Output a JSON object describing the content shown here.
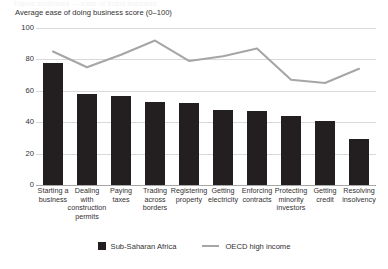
{
  "title_sliver": "Figure continued — ease of doing business",
  "axis_caption": "Average ease of doing business score (0–100)",
  "legend": {
    "items": [
      {
        "label": "Sub-Saharan Africa",
        "marker": "bar-swatch-icon",
        "color": "#231f20"
      },
      {
        "label": "OECD high income",
        "marker": "line-swatch-icon",
        "color": "#a6a6a6"
      }
    ]
  },
  "colors": {
    "bar": "#231f20",
    "line": "#a6a6a6",
    "grid": "#d9d9d9",
    "axis": "#a7a7a7",
    "text": "#333132",
    "background": "#ffffff"
  },
  "chart_data": {
    "type": "bar",
    "title": "",
    "subtitle": "",
    "xlabel": "",
    "ylabel": "Average ease of doing business score (0–100)",
    "ylim": [
      0,
      100
    ],
    "yticks": [
      0,
      20,
      40,
      60,
      80,
      100
    ],
    "grid": true,
    "legend_position": "bottom-center",
    "categories": [
      "Starting a business",
      "Dealing with construction permits",
      "Paying taxes",
      "Trading across borders",
      "Registering property",
      "Getting electricity",
      "Enforcing contracts",
      "Protecting minority investors",
      "Getting credit",
      "Resolving insolvency"
    ],
    "category_lines": [
      [
        "Starting a",
        "business"
      ],
      [
        "Dealing",
        "with",
        "construction",
        "permits"
      ],
      [
        "Paying",
        "taxes"
      ],
      [
        "Trading",
        "across",
        "borders"
      ],
      [
        "Registering",
        "property"
      ],
      [
        "Getting",
        "electricity"
      ],
      [
        "Enforcing",
        "contracts"
      ],
      [
        "Protecting",
        "minority",
        "investors"
      ],
      [
        "Getting",
        "credit"
      ],
      [
        "Resolving",
        "insolvency"
      ]
    ],
    "series": [
      {
        "name": "Sub-Saharan Africa",
        "render": "bar",
        "values": [
          78,
          58,
          57,
          53,
          52,
          48,
          47,
          44,
          41,
          29
        ]
      },
      {
        "name": "OECD high income",
        "render": "line",
        "values": [
          85,
          75,
          83,
          92,
          79,
          82,
          87,
          67,
          65,
          74
        ]
      }
    ]
  }
}
